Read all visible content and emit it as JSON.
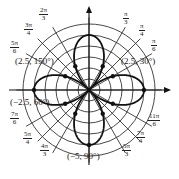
{
  "figure": {
    "type": "polar-graph",
    "curve": "four-petal rose r = 5 cos 2θ",
    "grid": {
      "circles": [
        1,
        2,
        3,
        4,
        5,
        6
      ],
      "radial_step_deg": 30,
      "radial_step_deg_alt": 45
    }
  },
  "angle_labels": [
    {
      "id": "a60",
      "num": "π",
      "den": "3",
      "x": 129,
      "y": 18
    },
    {
      "id": "a45",
      "num": "π",
      "den": "4",
      "x": 145,
      "y": 30
    },
    {
      "id": "a30",
      "num": "π",
      "den": "6",
      "x": 157,
      "y": 45
    },
    {
      "id": "a120",
      "num": "2π",
      "den": "3",
      "x": 45,
      "y": 14
    },
    {
      "id": "a135",
      "num": "3π",
      "den": "4",
      "x": 30,
      "y": 29
    },
    {
      "id": "a150",
      "num": "5π",
      "den": "6",
      "x": 16,
      "y": 47
    },
    {
      "id": "a210",
      "num": "7π",
      "den": "6",
      "x": 16,
      "y": 118
    },
    {
      "id": "a225",
      "num": "5π",
      "den": "4",
      "x": 29,
      "y": 138
    },
    {
      "id": "a240",
      "num": "4π",
      "den": "3",
      "x": 46,
      "y": 150
    },
    {
      "id": "a300",
      "num": "5π",
      "den": "3",
      "x": 128,
      "y": 150
    },
    {
      "id": "a315",
      "num": "7π",
      "den": "4",
      "x": 142,
      "y": 137
    },
    {
      "id": "a330",
      "num": "11π",
      "den": "6",
      "x": 154,
      "y": 120
    }
  ],
  "point_labels": [
    {
      "id": "p150",
      "text": "(2.5, 150°)",
      "x": 15,
      "y": 62
    },
    {
      "id": "p30",
      "text": "(2.5, 30°)",
      "x": 121,
      "y": 62
    },
    {
      "id": "p60neg",
      "text": "(−2.5, 60°)",
      "x": 10,
      "y": 103
    },
    {
      "id": "p90neg",
      "text": "(−5, 90°)",
      "x": 67,
      "y": 157
    }
  ],
  "points": [
    {
      "r": 2.5,
      "theta_deg": 150
    },
    {
      "r": 2.5,
      "theta_deg": 30
    },
    {
      "r": -2.5,
      "theta_deg": 60
    },
    {
      "r": -5,
      "theta_deg": 90
    },
    {
      "r": 5,
      "theta_deg": 0
    },
    {
      "r": 5,
      "theta_deg": 180
    },
    {
      "r": 2.5,
      "theta_deg": 210
    },
    {
      "r": 2.5,
      "theta_deg": 330
    },
    {
      "r": -2.5,
      "theta_deg": 120
    },
    {
      "r": -2.5,
      "theta_deg": 240
    },
    {
      "r": -2.5,
      "theta_deg": 300
    },
    {
      "r": 0,
      "theta_deg": 45
    }
  ]
}
